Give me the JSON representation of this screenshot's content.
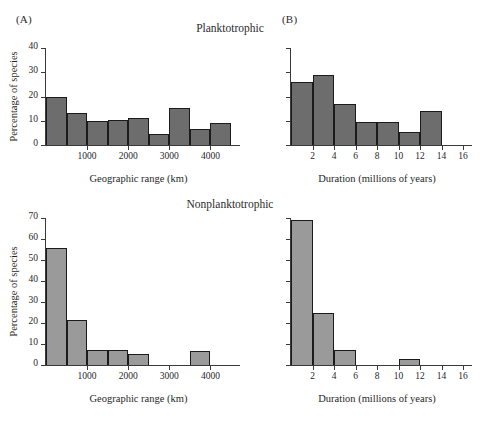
{
  "figure": {
    "panels": [
      {
        "key": "A",
        "label": "(A)"
      },
      {
        "key": "B",
        "label": "(B)"
      }
    ],
    "group_titles": [
      {
        "key": "planktotrophic",
        "label": "Planktotrophic"
      },
      {
        "key": "nonplanktotrophic",
        "label": "Nonplanktotrophic"
      }
    ],
    "colors": {
      "bar_planktotrophic": "#6d6d6d",
      "bar_nonplanktotrophic": "#9a9a9a",
      "bar_outline": "#1b1b1b",
      "axis": "#3a3a3a",
      "text": "#1f1f1f",
      "background": "#ffffff"
    }
  },
  "chart_data": [
    {
      "id": "A-top",
      "panel": "(A)",
      "type": "bar",
      "title": "Planktotrophic",
      "xlabel": "Geographic range (km)",
      "ylabel": "Percentage of species",
      "xlim": [
        0,
        4500
      ],
      "ylim": [
        0,
        40
      ],
      "xticks": [
        1000,
        2000,
        3000,
        4000
      ],
      "xtick_labels": [
        "1000",
        "2000",
        "3000",
        "4000"
      ],
      "yticks": [
        0,
        10,
        20,
        30,
        40
      ],
      "ytick_labels": [
        "0",
        "10",
        "20",
        "30",
        "40"
      ],
      "bin_edges": [
        0,
        500,
        1000,
        1500,
        2000,
        2500,
        3000,
        3500,
        4000,
        4500
      ],
      "values": [
        20,
        13,
        10,
        10.2,
        11.2,
        4.5,
        15.2,
        6.5,
        9
      ],
      "grid": false,
      "legend": "none"
    },
    {
      "id": "B-top",
      "panel": "(B)",
      "type": "bar",
      "title": "Planktotrophic",
      "xlabel": "Duration (millions of years)",
      "ylabel": "Percentage of species",
      "xlim": [
        0,
        16
      ],
      "ylim": [
        0,
        40
      ],
      "xticks": [
        2,
        4,
        6,
        8,
        10,
        12,
        14,
        16
      ],
      "xtick_labels": [
        "2",
        "4",
        "6",
        "8",
        "10",
        "12",
        "14",
        "16"
      ],
      "yticks": [
        0,
        10,
        20,
        30,
        40
      ],
      "ytick_labels": [
        "",
        "",
        "",
        "",
        ""
      ],
      "bin_edges": [
        0,
        2,
        4,
        6,
        8,
        10,
        12,
        14
      ],
      "values": [
        26,
        29,
        17,
        9.5,
        9.5,
        5.5,
        14
      ],
      "grid": false,
      "legend": "none"
    },
    {
      "id": "A-bottom",
      "panel": "(A)",
      "type": "bar",
      "title": "Nonplanktotrophic",
      "xlabel": "Geographic range (km)",
      "ylabel": "Percentage of species",
      "xlim": [
        0,
        4500
      ],
      "ylim": [
        0,
        70
      ],
      "xticks": [
        1000,
        2000,
        3000,
        4000
      ],
      "xtick_labels": [
        "1000",
        "2000",
        "3000",
        "4000"
      ],
      "yticks": [
        0,
        10,
        20,
        30,
        40,
        50,
        60,
        70
      ],
      "ytick_labels": [
        "0",
        "10",
        "20",
        "30",
        "40",
        "50",
        "60",
        "70"
      ],
      "bin_edges": [
        0,
        500,
        1000,
        1500,
        2000,
        2500,
        3000,
        3500,
        4000,
        4500
      ],
      "values": [
        55.5,
        21.5,
        7,
        7.2,
        5.2,
        0,
        0,
        6.7,
        0
      ],
      "grid": false,
      "legend": "none"
    },
    {
      "id": "B-bottom",
      "panel": "(B)",
      "type": "bar",
      "title": "Nonplanktotrophic",
      "xlabel": "Duration (millions of years)",
      "ylabel": "Percentage of species",
      "xlim": [
        0,
        16
      ],
      "ylim": [
        0,
        70
      ],
      "xticks": [
        2,
        4,
        6,
        8,
        10,
        12,
        14,
        16
      ],
      "xtick_labels": [
        "2",
        "4",
        "6",
        "8",
        "10",
        "12",
        "14",
        "16"
      ],
      "yticks": [
        0,
        10,
        20,
        30,
        40,
        50,
        60,
        70
      ],
      "ytick_labels": [
        "",
        "",
        "",
        "",
        "",
        "",
        "",
        ""
      ],
      "bin_edges": [
        0,
        2,
        4,
        6,
        8,
        10,
        12
      ],
      "values": [
        69,
        25,
        7,
        0,
        0,
        3
      ],
      "grid": false,
      "legend": "none"
    }
  ]
}
